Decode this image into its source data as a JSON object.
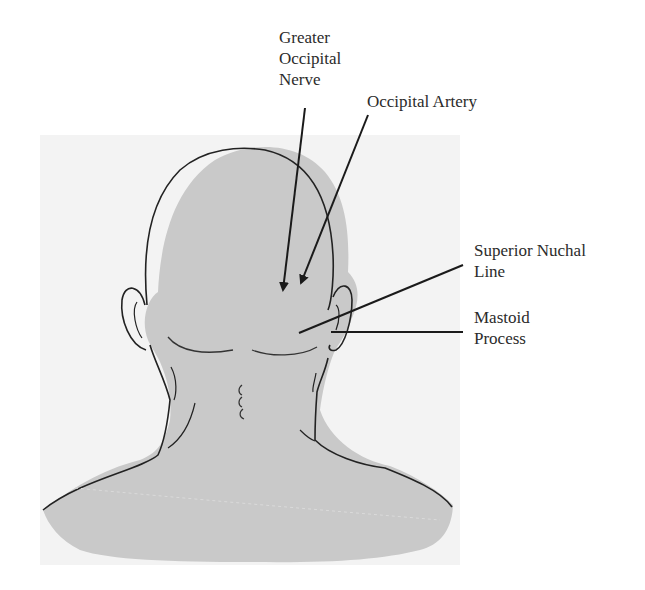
{
  "figure": {
    "labels": {
      "greater_occipital_nerve": [
        "Greater",
        "Occipital",
        "Nerve"
      ],
      "occipital_artery": "Occipital Artery",
      "superior_nuchal_line": [
        "Superior Nuchal",
        "Line"
      ],
      "mastoid_process": [
        "Mastoid",
        "Process"
      ]
    },
    "colors": {
      "background_panel": "#f3f3f3",
      "body_fill": "#c9c9c9",
      "outline": "#222222"
    }
  }
}
